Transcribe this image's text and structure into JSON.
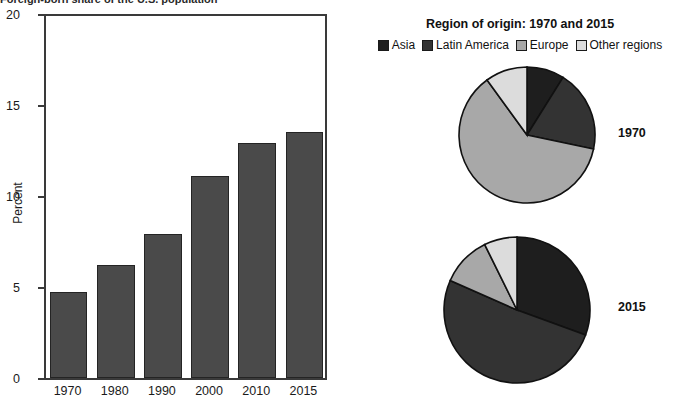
{
  "figure": {
    "cropped_top_title": "Foreign-born share of the U.S. population"
  },
  "bar_chart": {
    "ylabel": "Percent",
    "yticks": [
      "0",
      "5",
      "10",
      "15",
      "20"
    ],
    "xticks": [
      "1970",
      "1980",
      "1990",
      "2000",
      "2010",
      "2015"
    ],
    "bar_labels": [
      "4.7",
      "6.2",
      "7.9",
      "11.1",
      "12.9",
      "13.5"
    ],
    "bar_color": "#4a4a4a"
  },
  "pie_panel": {
    "title": "Region of origin: 1970 and 2015",
    "legend": [
      {
        "label": "Asia",
        "color": "#1e1e1e"
      },
      {
        "label": "Latin America",
        "color": "#333333"
      },
      {
        "label": "Europe",
        "color": "#a8a8a8"
      },
      {
        "label": "Other regions",
        "color": "#dcdcdc"
      }
    ],
    "pies": [
      {
        "year": "1970",
        "labels": [
          "8.9",
          "19.4",
          "61.7",
          "10.0"
        ]
      },
      {
        "year": "2015",
        "labels": [
          "30.6",
          "51.1",
          "11.1",
          "7.3"
        ]
      }
    ]
  },
  "chart_data": [
    {
      "type": "bar",
      "title": "Foreign-born share of the U.S. population",
      "xlabel": "",
      "ylabel": "Percent",
      "categories": [
        "1970",
        "1980",
        "1990",
        "2000",
        "2010",
        "2015"
      ],
      "values": [
        4.7,
        6.2,
        7.9,
        11.1,
        12.9,
        13.5
      ],
      "ylim": [
        0,
        20
      ],
      "yticks": [
        0,
        5,
        10,
        15,
        20
      ],
      "grid": false,
      "legend": "none",
      "bar_color": "#4a4a4a"
    },
    {
      "type": "pie",
      "title": "Region of origin: 1970 and 2015",
      "subtitle": "1970",
      "labels": [
        "Asia",
        "Latin America",
        "Europe",
        "Other regions"
      ],
      "values": [
        8.9,
        19.4,
        61.7,
        10.0
      ],
      "colors": [
        "#1e1e1e",
        "#333333",
        "#a8a8a8",
        "#dcdcdc"
      ],
      "legend": "top",
      "units": "percent"
    },
    {
      "type": "pie",
      "title": "Region of origin: 1970 and 2015",
      "subtitle": "2015",
      "labels": [
        "Asia",
        "Latin America",
        "Europe",
        "Other regions"
      ],
      "values": [
        30.6,
        51.1,
        11.1,
        7.3
      ],
      "colors": [
        "#1e1e1e",
        "#333333",
        "#a8a8a8",
        "#dcdcdc"
      ],
      "legend": "top",
      "units": "percent"
    }
  ]
}
